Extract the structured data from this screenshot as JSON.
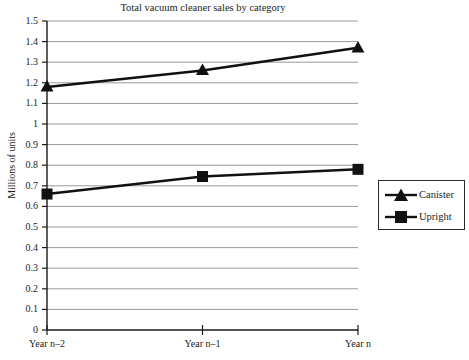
{
  "chart_data": {
    "type": "line",
    "title": "Total vacuum cleaner sales by category",
    "xlabel": "",
    "ylabel": "Millions of units",
    "categories": [
      "Year n–2",
      "Year n–1",
      "Year n"
    ],
    "series": [
      {
        "name": "Canister",
        "marker": "triangle",
        "color": "#111111",
        "values": [
          1.18,
          1.26,
          1.37
        ]
      },
      {
        "name": "Upright",
        "marker": "square",
        "color": "#111111",
        "values": [
          0.66,
          0.745,
          0.78
        ]
      }
    ],
    "ylim": [
      0,
      1.5
    ],
    "ytick_step": 0.1,
    "ytick_labels": [
      "1.5",
      "1.4",
      "1.3",
      "1.2",
      "1.1",
      "1",
      "0.9",
      "0.8",
      "0.7",
      "0.6",
      "0.5",
      "0.4",
      "0.3",
      "0.2",
      "0.1",
      "0"
    ],
    "ytick_values": [
      1.5,
      1.4,
      1.3,
      1.2,
      1.1,
      1.0,
      0.9,
      0.8,
      0.7,
      0.6,
      0.5,
      0.4,
      0.3,
      0.2,
      0.1,
      0
    ],
    "grid": true,
    "grid_color": "#999999",
    "axis_color": "#1a1a1a",
    "legend_position": "right",
    "legend_entries": [
      "Canister",
      "Upright"
    ],
    "background": "#ffffff"
  },
  "legend": {
    "items": [
      {
        "label": "Canister"
      },
      {
        "label": "Upright"
      }
    ]
  }
}
